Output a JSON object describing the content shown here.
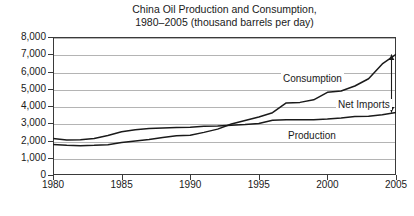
{
  "chart_data": {
    "type": "line",
    "title": "China Oil Production and Consumption, 1980–2005 (thousand barrels per day)",
    "title_line1": "China Oil Production and Consumption,",
    "title_line2": "1980–2005 (thousand barrels per day)",
    "xlabel": "",
    "ylabel": "",
    "xlim": [
      1980,
      2005
    ],
    "ylim": [
      0,
      8000
    ],
    "grid": true,
    "legend_position": "inline-annotations",
    "y_ticks": [
      "0",
      "1,000",
      "2,000",
      "3,000",
      "4,000",
      "5,000",
      "6,000",
      "7,000",
      "8,000"
    ],
    "y_tick_values": [
      0,
      1000,
      2000,
      3000,
      4000,
      5000,
      6000,
      7000,
      8000
    ],
    "x_ticks": [
      "1980",
      "1985",
      "1990",
      "1995",
      "2000",
      "2005"
    ],
    "x_tick_values": [
      1980,
      1985,
      1990,
      1995,
      2000,
      2005
    ],
    "x": [
      1980,
      1981,
      1982,
      1983,
      1984,
      1985,
      1986,
      1987,
      1988,
      1989,
      1990,
      1991,
      1992,
      1993,
      1994,
      1995,
      1996,
      1997,
      1998,
      1999,
      2000,
      2001,
      2002,
      2003,
      2004,
      2005
    ],
    "series": [
      {
        "name": "Production",
        "label": "Production",
        "values": [
          2114,
          2025,
          2045,
          2120,
          2290,
          2505,
          2620,
          2690,
          2730,
          2760,
          2770,
          2830,
          2840,
          2890,
          2930,
          2990,
          3170,
          3210,
          3210,
          3210,
          3250,
          3310,
          3390,
          3410,
          3490,
          3620
        ]
      },
      {
        "name": "Consumption",
        "label": "Consumption",
        "values": [
          1765,
          1720,
          1700,
          1720,
          1760,
          1885,
          1965,
          2060,
          2180,
          2280,
          2300,
          2470,
          2660,
          2960,
          3160,
          3360,
          3610,
          4180,
          4210,
          4360,
          4790,
          4870,
          5160,
          5580,
          6440,
          6990
        ]
      }
    ],
    "annotations": [
      {
        "name": "consumption-label",
        "text": "Consumption"
      },
      {
        "name": "net-imports-label",
        "text": "Net Imports"
      },
      {
        "name": "production-label",
        "text": "Production"
      }
    ],
    "net_imports_arrow": {
      "year": 2005,
      "top_value": 6990,
      "bottom_value": 3620,
      "label": "Net Imports"
    },
    "colors": {
      "line": "#1a1a1a",
      "grid": "#b4b4b4",
      "axis": "#3a3a3a",
      "background": "#ffffff",
      "text": "#1a1a1a"
    }
  }
}
